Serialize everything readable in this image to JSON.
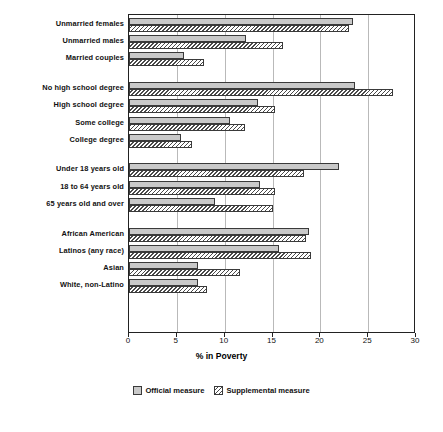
{
  "chart_data": {
    "type": "bar",
    "orientation": "horizontal",
    "title": "",
    "xlabel": "% in Poverty",
    "ylabel": "",
    "xlim": [
      0,
      30
    ],
    "xticks": [
      0,
      5,
      10,
      15,
      20,
      25,
      30
    ],
    "xticklabels": [
      "0",
      "5",
      "10",
      "15",
      "20",
      "25",
      "30"
    ],
    "grid": "vertical",
    "legend_position": "below",
    "categories": [
      "Unmarried females",
      "Unmarried males",
      "Married couples",
      "No high school degree",
      "High school degree",
      "Some college",
      "College degree",
      "Under 18 years old",
      "18 to 64 years old",
      "65 years old and over",
      "African American",
      "Latinos (any race)",
      "Asian",
      "White, non-Latino"
    ],
    "group_breaks_after": [
      2,
      6,
      9
    ],
    "series": [
      {
        "name": "Official measure",
        "values": [
          23.4,
          12.2,
          5.7,
          23.6,
          13.5,
          10.6,
          5.4,
          22.0,
          13.7,
          9.0,
          18.8,
          15.7,
          7.2,
          7.2
        ]
      },
      {
        "name": "Supplemental measure",
        "values": [
          23.0,
          16.1,
          7.8,
          27.6,
          15.3,
          12.1,
          6.6,
          18.3,
          15.3,
          15.1,
          18.5,
          19.0,
          11.6,
          8.2
        ]
      }
    ]
  },
  "legend": {
    "items": [
      {
        "label": "Official measure",
        "swatch": "official-swatch"
      },
      {
        "label": "Supplemental measure",
        "swatch": "supplemental-swatch"
      }
    ]
  },
  "colors": {
    "official_fill": "#c9c9c9",
    "supplemental_hatch": "#4a4a4a",
    "bar_border": "#3a3a3a",
    "gridline": "#b9b9b9",
    "axis": "#222222"
  }
}
